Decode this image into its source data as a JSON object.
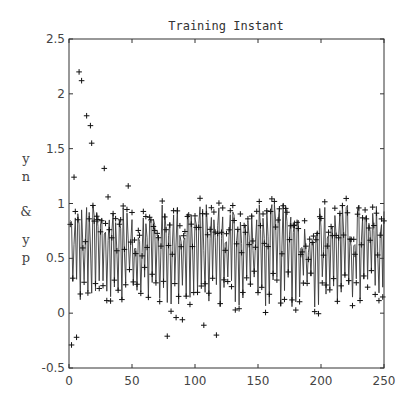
{
  "chart_data": {
    "type": "line+scatter",
    "title": "Training Instant",
    "xlabel": "",
    "ylabel": "yn & yp",
    "ylabel_stacked": [
      "y",
      "n",
      "&",
      "y",
      "p"
    ],
    "xlim": [
      0,
      250
    ],
    "ylim": [
      -0.5,
      2.5
    ],
    "xticks": [
      0,
      50,
      100,
      150,
      200,
      250
    ],
    "xtick_labels": [
      "0",
      "50",
      "100",
      "150",
      "200",
      "250"
    ],
    "yticks": [
      -0.5,
      0,
      0.5,
      1,
      1.5,
      2,
      2.5
    ],
    "ytick_labels": [
      "-0.5",
      "0",
      "0.5",
      "1",
      "1.5",
      "2",
      "2.5"
    ],
    "grid": false,
    "legend": null,
    "series": [
      {
        "name": "yp",
        "style": "line",
        "color": "#333333",
        "description": "Network prediction, oscillating roughly between 0 and 1 over instants 1-250"
      },
      {
        "name": "yn",
        "style": "marker-plus",
        "color": "#111111",
        "description": "Target values, mostly within 0-1 with early outliers up to ~2.2 and several below 0",
        "outliers": [
          {
            "x": 2,
            "y": -0.29
          },
          {
            "x": 4,
            "y": 1.24
          },
          {
            "x": 6,
            "y": -0.22
          },
          {
            "x": 8,
            "y": 2.2
          },
          {
            "x": 10,
            "y": 2.12
          },
          {
            "x": 14,
            "y": 1.8
          },
          {
            "x": 17,
            "y": 1.71
          },
          {
            "x": 18,
            "y": 1.55
          },
          {
            "x": 28,
            "y": 1.32
          },
          {
            "x": 31,
            "y": 1.06
          },
          {
            "x": 47,
            "y": 1.16
          },
          {
            "x": 78,
            "y": -0.21
          },
          {
            "x": 85,
            "y": -0.04
          },
          {
            "x": 90,
            "y": -0.06
          },
          {
            "x": 107,
            "y": -0.11
          },
          {
            "x": 117,
            "y": -0.2
          }
        ]
      }
    ],
    "n_points": 250,
    "typical_range": [
      0,
      1
    ]
  }
}
